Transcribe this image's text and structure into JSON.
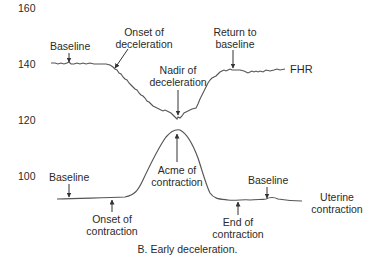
{
  "figure": {
    "caption": "B. Early deceleration.",
    "y_axis_ticks": [
      "160",
      "140",
      "120",
      "100"
    ],
    "fhr_trace": {
      "label": "FHR",
      "annotations": {
        "baseline": "Baseline",
        "onset_line1": "Onset of",
        "onset_line2": "deceleration",
        "nadir_line1": "Nadir of",
        "nadir_line2": "deceleration",
        "return_line1": "Return to",
        "return_line2": "baseline"
      }
    },
    "uterine_trace": {
      "label_line1": "Uterine",
      "label_line2": "contraction",
      "annotations": {
        "baseline_left": "Baseline",
        "onset_line1": "Onset of",
        "onset_line2": "contraction",
        "acme_line1": "Acme of",
        "acme_line2": "contraction",
        "end_line1": "End of",
        "end_line2": "contraction",
        "baseline_right": "Baseline"
      }
    },
    "colors": {
      "trace": "#555555",
      "text": "#2a2a2a",
      "background": "#ffffff"
    }
  }
}
